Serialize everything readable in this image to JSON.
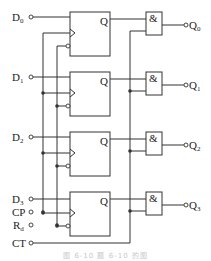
{
  "diagram": {
    "type": "4-bit register with output-enable AND gates",
    "inputs": [
      {
        "name": "D",
        "sub": "0",
        "y": 17
      },
      {
        "name": "D",
        "sub": "1",
        "y": 77
      },
      {
        "name": "D",
        "sub": "2",
        "y": 137
      },
      {
        "name": "D",
        "sub": "3",
        "y": 199
      },
      {
        "name": "CP",
        "sub": "",
        "y": 212
      },
      {
        "name": "R",
        "sub": "d",
        "y": 225
      },
      {
        "name": "CT",
        "sub": "",
        "y": 243
      }
    ],
    "flip_flops": [
      {
        "output_label": "Q",
        "top": 12
      },
      {
        "output_label": "Q",
        "top": 72
      },
      {
        "output_label": "Q",
        "top": 132
      },
      {
        "output_label": "Q",
        "top": 192
      }
    ],
    "and_gates": [
      {
        "symbol": "&",
        "top": 12
      },
      {
        "symbol": "&",
        "top": 72
      },
      {
        "symbol": "&",
        "top": 132
      },
      {
        "symbol": "&",
        "top": 192
      }
    ],
    "outputs": [
      {
        "name": "Q",
        "sub": "0"
      },
      {
        "name": "Q",
        "sub": "1"
      },
      {
        "name": "Q",
        "sub": "2"
      },
      {
        "name": "Q",
        "sub": "3"
      }
    ],
    "caption": "图 6-10  题 6-10 的图"
  }
}
